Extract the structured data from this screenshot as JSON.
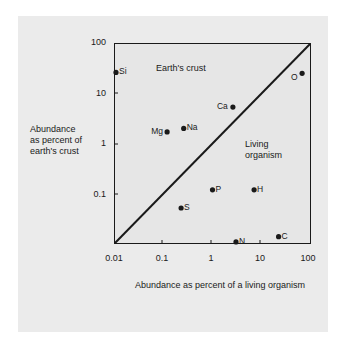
{
  "chart_data": {
    "type": "scatter",
    "title": "",
    "xlabel": "Abundance as percent of a living organism",
    "ylabel": [
      "Abundance",
      "as percent of",
      "earth's crust"
    ],
    "xscale": "log",
    "yscale": "log",
    "xlim": [
      0.01,
      100
    ],
    "ylim": [
      0.01,
      100
    ],
    "x_ticks": [
      "0.01",
      "0.1",
      "1",
      "10",
      "100"
    ],
    "y_ticks": [
      "100",
      "10",
      "1",
      "0.1"
    ],
    "grid": false,
    "reference_line": "y = x diagonal",
    "regions": {
      "upper_left": "Earth's crust",
      "lower_right": [
        "Living",
        "organism"
      ]
    },
    "points": [
      {
        "label": "Si",
        "x": 0.011,
        "y": 26
      },
      {
        "label": "O",
        "x": 66,
        "y": 25
      },
      {
        "label": "Ca",
        "x": 2.6,
        "y": 5.3
      },
      {
        "label": "Mg",
        "x": 0.12,
        "y": 1.7
      },
      {
        "label": "Na",
        "x": 0.26,
        "y": 2.0
      },
      {
        "label": "P",
        "x": 1.0,
        "y": 0.12
      },
      {
        "label": "H",
        "x": 7.0,
        "y": 0.12
      },
      {
        "label": "S",
        "x": 0.23,
        "y": 0.052
      },
      {
        "label": "N",
        "x": 3.0,
        "y": 0.011
      },
      {
        "label": "C",
        "x": 22,
        "y": 0.014
      }
    ]
  },
  "colors": {
    "panel_bg": "#ebebeb",
    "ink": "#1a1a1a"
  }
}
